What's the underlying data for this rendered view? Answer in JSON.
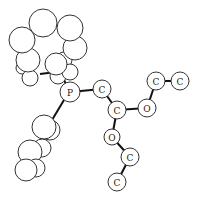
{
  "diagram": {
    "type": "ball-and-stick molecular structure",
    "labeled_atoms": [
      {
        "id": "P1",
        "label": "P",
        "x": 70,
        "y": 92,
        "r": 10
      },
      {
        "id": "C1",
        "label": "C",
        "x": 102,
        "y": 89,
        "r": 9
      },
      {
        "id": "C2",
        "label": "C",
        "x": 117,
        "y": 110,
        "r": 9
      },
      {
        "id": "O1",
        "label": "O",
        "x": 147,
        "y": 108,
        "r": 9
      },
      {
        "id": "C3",
        "label": "C",
        "x": 156,
        "y": 81,
        "r": 9
      },
      {
        "id": "C4",
        "label": "C",
        "x": 180,
        "y": 81,
        "r": 9
      },
      {
        "id": "O2",
        "label": "O",
        "x": 112,
        "y": 137,
        "r": 8
      },
      {
        "id": "C5",
        "label": "C",
        "x": 130,
        "y": 157,
        "r": 9
      },
      {
        "id": "C6",
        "label": "C",
        "x": 117,
        "y": 182,
        "r": 9
      }
    ],
    "bonds": [
      [
        "P1",
        "C1"
      ],
      [
        "C1",
        "C2"
      ],
      [
        "C2",
        "O1"
      ],
      [
        "O1",
        "C3"
      ],
      [
        "C3",
        "C4"
      ],
      [
        "C2",
        "O2"
      ],
      [
        "O2",
        "C5"
      ],
      [
        "C5",
        "C6"
      ]
    ]
  }
}
